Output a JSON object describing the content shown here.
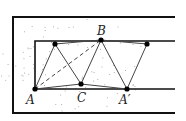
{
  "diagram": {
    "type": "geometric-construction",
    "colors": {
      "line": "#111111",
      "thin": "#444444",
      "point": "#000000",
      "dots": "#999999"
    },
    "outer_frame": {
      "left": 13,
      "top": 17,
      "bottom": 113,
      "right": 175
    },
    "inner_strip": {
      "left": 35,
      "top": 41,
      "bottom": 89,
      "right": 175
    },
    "points": [
      {
        "id": "A",
        "label": "A",
        "x": 35,
        "y": 89,
        "lx": 26,
        "ly": 104
      },
      {
        "id": "P1",
        "label": "",
        "x": 55,
        "y": 44
      },
      {
        "id": "C",
        "label": "C",
        "x": 81,
        "y": 84,
        "lx": 77,
        "ly": 102
      },
      {
        "id": "B",
        "label": "B",
        "x": 101,
        "y": 40,
        "lx": 97,
        "ly": 35
      },
      {
        "id": "A2",
        "label": "A′",
        "x": 127,
        "y": 89,
        "lx": 119,
        "ly": 104
      },
      {
        "id": "P2",
        "label": "",
        "x": 147,
        "y": 44
      }
    ],
    "segments": [
      [
        "A",
        "P1"
      ],
      [
        "P1",
        "C"
      ],
      [
        "C",
        "B"
      ],
      [
        "B",
        "A2"
      ],
      [
        "A2",
        "P2"
      ],
      [
        "P1",
        "B"
      ],
      [
        "B",
        "P2"
      ],
      [
        "A",
        "C"
      ],
      [
        "C",
        "A2"
      ]
    ],
    "dashed": [
      [
        "A",
        "B"
      ]
    ]
  }
}
